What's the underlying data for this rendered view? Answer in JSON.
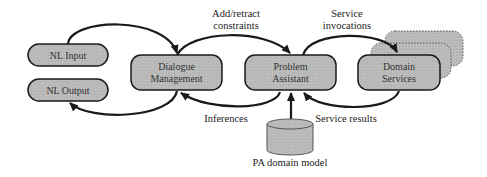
{
  "diagram": {
    "nodes": {
      "nl_input": {
        "label": "NL Input"
      },
      "nl_output": {
        "label": "NL Output"
      },
      "dialogue": {
        "line1": "Dialogue",
        "line2": "Management"
      },
      "problem": {
        "line1": "Problem",
        "line2": "Assistant"
      },
      "domain": {
        "line1": "Domain",
        "line2": "Services"
      },
      "pa_model": {
        "label": "PA domain model"
      }
    },
    "edges": {
      "add_retract": {
        "line1": "Add/retract",
        "line2": "constraints"
      },
      "service_invocations": {
        "line1": "Service",
        "line2": "invocations"
      },
      "inferences": {
        "label": "Inferences"
      },
      "service_results": {
        "label": "Service results"
      }
    },
    "colors": {
      "box_fill": "#b4b4b4",
      "stroke": "#1a1a1a",
      "background": "#ffffff"
    }
  }
}
